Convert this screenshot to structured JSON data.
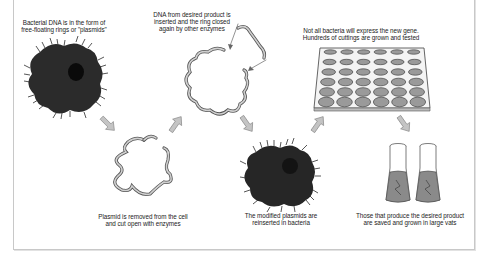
{
  "diagram": {
    "steps": [
      {
        "id": 1,
        "caption_lines": [
          "Bacterial DNA is in the form of",
          "free-floating rings or \"plasmids\""
        ],
        "graphic": "bacterium-with-nucleus"
      },
      {
        "id": 2,
        "caption_lines": [
          "Plasmid is removed from the cell",
          "and cut open with enzymes"
        ],
        "graphic": "open-plasmid-ring"
      },
      {
        "id": 3,
        "caption_lines": [
          "DNA from desired product is",
          "inserted and the ring closed",
          "again by other enzymes"
        ],
        "graphic": "plasmid-with-inserted-dna"
      },
      {
        "id": 4,
        "caption_lines": [
          "The modified plasmids are",
          "reinserted in bacteria"
        ],
        "graphic": "bacterium-with-nucleus"
      },
      {
        "id": 5,
        "caption_lines": [
          "Not all bacteria will express the new gene.",
          "Hundreds of cuttings are grown and tested"
        ],
        "graphic": "culture-plate-6x6"
      },
      {
        "id": 6,
        "caption_lines": [
          "Those that produce the desired product",
          "are saved and grown in large vats"
        ],
        "graphic": "two-culture-vats"
      }
    ],
    "plate": {
      "rows": 6,
      "cols": 6
    },
    "colors": {
      "cell": "#2b2b2b",
      "nucleus": "#111111",
      "arrow": "#b8b8b8",
      "well": "#9a9a9a",
      "liquid": "#8a8a8a",
      "border": "#c8c8c8"
    }
  }
}
